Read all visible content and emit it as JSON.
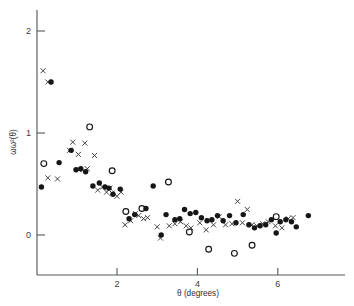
{
  "chart_data": {
    "type": "scatter",
    "title": "",
    "xlabel": "θ  (degrees)",
    "ylabel": "ωω²(θ)",
    "xlim": [
      0,
      7.7
    ],
    "ylim": [
      -0.4,
      2.6
    ],
    "grid": false,
    "legend_position": "none",
    "xticks": [
      2,
      4,
      6
    ],
    "xtick_labels": [
      "2",
      "4",
      "6"
    ],
    "yticks": [
      0,
      1,
      2
    ],
    "ytick_labels": [
      "0",
      "1",
      "2"
    ],
    "colors": {
      "axis": "#555a5c",
      "filled_circle": "#161616",
      "open_circle": "#161616",
      "cross": "#3a3a3a",
      "background": "#ffffff"
    },
    "series": [
      {
        "name": "cross",
        "marker": "x",
        "points": [
          [
            0.16,
            1.61
          ],
          [
            0.28,
            1.5
          ],
          [
            0.28,
            0.56
          ],
          [
            0.52,
            0.55
          ],
          [
            0.82,
            0.83
          ],
          [
            0.9,
            0.91
          ],
          [
            1.04,
            0.79
          ],
          [
            1.2,
            0.9
          ],
          [
            1.06,
            0.64
          ],
          [
            1.26,
            0.65
          ],
          [
            1.44,
            0.78
          ],
          [
            1.52,
            0.44
          ],
          [
            1.64,
            0.47
          ],
          [
            1.74,
            0.42
          ],
          [
            1.82,
            0.46
          ],
          [
            1.88,
            0.41
          ],
          [
            2.0,
            0.38
          ],
          [
            2.1,
            0.42
          ],
          [
            2.2,
            0.1
          ],
          [
            2.34,
            0.14
          ],
          [
            2.46,
            0.21
          ],
          [
            2.54,
            0.19
          ],
          [
            2.66,
            0.16
          ],
          [
            2.76,
            0.17
          ],
          [
            3.0,
            0.08
          ],
          [
            3.08,
            -0.03
          ],
          [
            3.3,
            0.09
          ],
          [
            3.44,
            0.11
          ],
          [
            3.58,
            0.13
          ],
          [
            3.72,
            0.09
          ],
          [
            3.84,
            0.07
          ],
          [
            4.06,
            0.12
          ],
          [
            4.22,
            0.05
          ],
          [
            4.4,
            0.1
          ],
          [
            4.54,
            0.18
          ],
          [
            4.7,
            0.1
          ],
          [
            4.86,
            0.11
          ],
          [
            5.0,
            0.33
          ],
          [
            5.12,
            0.12
          ],
          [
            5.24,
            0.25
          ],
          [
            5.36,
            0.1
          ],
          [
            5.48,
            0.09
          ],
          [
            5.62,
            0.11
          ],
          [
            5.76,
            0.13
          ],
          [
            5.94,
            0.09
          ],
          [
            6.1,
            0.07
          ],
          [
            6.26,
            0.16
          ],
          [
            6.38,
            0.17
          ]
        ]
      },
      {
        "name": "filled-circle",
        "marker": "o-filled",
        "points": [
          [
            0.36,
            1.5
          ],
          [
            0.12,
            0.47
          ],
          [
            0.56,
            0.71
          ],
          [
            0.86,
            0.83
          ],
          [
            0.98,
            0.64
          ],
          [
            1.1,
            0.65
          ],
          [
            1.22,
            0.62
          ],
          [
            1.4,
            0.48
          ],
          [
            1.56,
            0.51
          ],
          [
            1.7,
            0.47
          ],
          [
            1.8,
            0.46
          ],
          [
            1.9,
            0.4
          ],
          [
            2.08,
            0.45
          ],
          [
            2.3,
            0.16
          ],
          [
            2.44,
            0.2
          ],
          [
            2.72,
            0.26
          ],
          [
            2.9,
            0.48
          ],
          [
            3.1,
            0.0
          ],
          [
            3.22,
            0.2
          ],
          [
            3.44,
            0.15
          ],
          [
            3.56,
            0.16
          ],
          [
            3.68,
            0.25
          ],
          [
            3.82,
            0.21
          ],
          [
            3.96,
            0.22
          ],
          [
            4.1,
            0.17
          ],
          [
            4.24,
            0.14
          ],
          [
            4.36,
            0.15
          ],
          [
            4.5,
            0.19
          ],
          [
            4.64,
            0.14
          ],
          [
            4.8,
            0.19
          ],
          [
            4.96,
            0.12
          ],
          [
            5.14,
            0.2
          ],
          [
            5.28,
            0.1
          ],
          [
            5.42,
            0.07
          ],
          [
            5.56,
            0.09
          ],
          [
            5.7,
            0.1
          ],
          [
            5.84,
            0.15
          ],
          [
            5.96,
            0.02
          ],
          [
            6.06,
            0.13
          ],
          [
            6.2,
            0.15
          ],
          [
            6.34,
            0.13
          ],
          [
            6.46,
            0.08
          ],
          [
            6.76,
            0.19
          ]
        ]
      },
      {
        "name": "open-circle",
        "marker": "o-open",
        "points": [
          [
            0.18,
            0.7
          ],
          [
            1.32,
            1.06
          ],
          [
            1.88,
            0.63
          ],
          [
            2.22,
            0.23
          ],
          [
            2.62,
            0.26
          ],
          [
            3.28,
            0.52
          ],
          [
            3.8,
            0.03
          ],
          [
            4.28,
            -0.14
          ],
          [
            4.92,
            -0.18
          ],
          [
            5.36,
            -0.1
          ],
          [
            5.96,
            0.18
          ]
        ]
      }
    ]
  },
  "figure": {
    "caption": ""
  }
}
